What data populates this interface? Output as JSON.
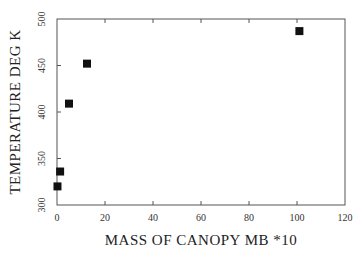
{
  "chart_data": {
    "type": "scatter",
    "title": "",
    "xlabel": "MASS OF CANOPY   MB   *10",
    "ylabel": "TEMPERATURE   DEG  K",
    "xlim": [
      0,
      120
    ],
    "ylim": [
      300,
      500
    ],
    "xticks": [
      0,
      20,
      40,
      60,
      80,
      100,
      120
    ],
    "yticks": [
      300,
      350,
      400,
      450,
      500
    ],
    "grid": false,
    "legend": null,
    "marker": "square",
    "series": [
      {
        "name": "canopy temperature",
        "points": [
          {
            "x": 0.2,
            "y": 320
          },
          {
            "x": 1.3,
            "y": 336
          },
          {
            "x": 5,
            "y": 409
          },
          {
            "x": 12.5,
            "y": 452
          },
          {
            "x": 101,
            "y": 487
          }
        ]
      }
    ]
  }
}
